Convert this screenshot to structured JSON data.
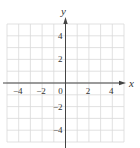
{
  "chart_data": {
    "type": "scatter",
    "title": "",
    "xlabel": "x",
    "ylabel": "y",
    "xlim": [
      -5,
      5
    ],
    "ylim": [
      -5,
      5
    ],
    "grid": true,
    "grid_step": 1,
    "x_ticks": [
      -4,
      -2,
      0,
      2,
      4
    ],
    "y_ticks": [
      4,
      2,
      -2,
      -4
    ],
    "x_tick_labels": [
      "−4",
      "−2",
      "0",
      "2",
      "4"
    ],
    "y_tick_labels": [
      "4",
      "2",
      "−2",
      "−4"
    ],
    "series": [],
    "legend": null
  },
  "colors": {
    "grid": "#d9d9d9",
    "axis": "#444444",
    "label": "#333333"
  }
}
